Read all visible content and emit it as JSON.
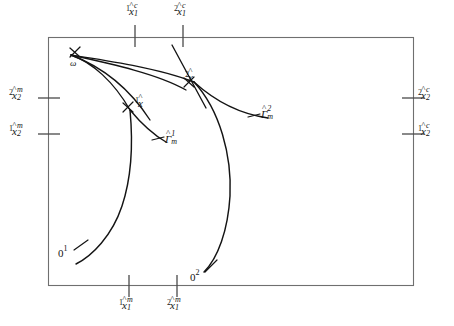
{
  "figure": {
    "kind": "mathematical-phase-plane-diagram",
    "frame": {
      "x": 48,
      "y": 37,
      "width": 365,
      "height": 248,
      "stroke": "#6f6f6f"
    },
    "curve_color": "#141414",
    "tick_color": "#4a4a4a"
  },
  "axis_labels": {
    "top": [
      {
        "id": "top-tick-1",
        "pre": "1",
        "var": "x",
        "hat": "^",
        "sup": "c",
        "sub": "1",
        "x": 131,
        "y": 4
      },
      {
        "id": "top-tick-2",
        "pre": "2",
        "var": "x",
        "hat": "^",
        "sup": "c",
        "sub": "1",
        "x": 178,
        "y": 4
      }
    ],
    "left": [
      {
        "id": "left-tick-2",
        "pre": "2",
        "var": "x",
        "hat": "^",
        "sup": "m",
        "sub": "2",
        "x": 9,
        "y": 90
      },
      {
        "id": "left-tick-1",
        "pre": "1",
        "var": "x",
        "hat": "^",
        "sup": "m",
        "sub": "2",
        "x": 9,
        "y": 126
      }
    ],
    "right": [
      {
        "id": "right-tick-2",
        "pre": "2",
        "var": "x",
        "hat": "^",
        "sup": "c",
        "sub": "2",
        "x": 418,
        "y": 90
      },
      {
        "id": "right-tick-1",
        "pre": "1",
        "var": "x",
        "hat": "^",
        "sup": "c",
        "sub": "2",
        "x": 418,
        "y": 126
      }
    ],
    "bottom": [
      {
        "id": "bottom-tick-1",
        "pre": "1",
        "var": "x",
        "hat": "^",
        "sup": "m",
        "sub": "1",
        "x": 118,
        "y": 296
      },
      {
        "id": "bottom-tick-2",
        "pre": "2",
        "var": "x",
        "hat": "^",
        "sup": "m",
        "sub": "1",
        "x": 166,
        "y": 296
      }
    ]
  },
  "point_labels": [
    {
      "id": "omega",
      "text": "ω",
      "x": 70,
      "y": 61
    },
    {
      "id": "x-hat-1",
      "pre": "1",
      "var": "x",
      "hat": "^",
      "x": 128,
      "y": 98
    },
    {
      "id": "x-hat-2",
      "pre": "2",
      "var": "x",
      "hat": "^",
      "x": 184,
      "y": 73
    },
    {
      "id": "origin-1",
      "num": "0",
      "supn": "1",
      "x": 58,
      "y": 249
    },
    {
      "id": "origin-2",
      "num": "0",
      "supn": "2",
      "x": 194,
      "y": 274
    }
  ],
  "manifold_labels": [
    {
      "id": "gamma-hat-1-m",
      "var": "Γ",
      "hat": "^",
      "sup": "1",
      "sub": "m",
      "x": 166,
      "y": 135
    },
    {
      "id": "gamma-hat-2-m",
      "var": "Γ",
      "hat": "^",
      "sup": "2",
      "sub": "m",
      "x": 262,
      "y": 110
    }
  ],
  "ticks": {
    "top": [
      {
        "x": 135,
        "y1": 25,
        "y2": 47
      },
      {
        "x": 183,
        "y1": 25,
        "y2": 47
      }
    ],
    "bottom": [
      {
        "x": 129,
        "y1": 275,
        "y2": 297
      },
      {
        "x": 177,
        "y1": 275,
        "y2": 297
      }
    ],
    "left": [
      {
        "y": 98,
        "x1": 38,
        "x2": 60
      },
      {
        "y": 134,
        "x1": 38,
        "x2": 60
      }
    ],
    "right": [
      {
        "y": 98,
        "x1": 402,
        "x2": 424
      },
      {
        "y": 134,
        "x1": 402,
        "x2": 424
      }
    ]
  },
  "paths": {
    "trajectory_1": "M 76,264 C 92,256 112,236 122,206 C 132,176 133,142 130,110",
    "trajectory_2": "M 204,272 C 218,258 228,230 230,196 C 232,156 220,110 194,82",
    "ray_omega_to_xhat1": "M 71,55 C 92,62 114,82 130,110",
    "ray_omega_to_xhat2": "M 71,55 C 104,60 158,68 194,82",
    "ray_omega_mid_a": "M 71,55 C 100,66 128,86 150,120",
    "ray_omega_mid_b": "M 71,55 C 112,64 158,74 186,90",
    "manifold_1": "M 130,110 C 140,122 152,134 166,142",
    "manifold_2": "M 194,82 C 216,102 240,114 268,118",
    "manifold_2_upper": "M 172,45 C 180,60 190,78 206,108",
    "short_tail_right": "M 194,82 C 200,92 204,100 208,110",
    "leader_origin_1": "M 74,250 L 86,242",
    "leader_origin_2": "M 203,272 L 214,261",
    "leader_gamma_1": "M 152,140 L 163,137",
    "leader_gamma_2": "M 248,117 L 260,114"
  },
  "crosses": [
    {
      "id": "cross-omega",
      "x": 75,
      "y": 52,
      "r": 5
    },
    {
      "id": "cross-x-hat-1",
      "x": 128,
      "y": 107,
      "r": 5
    },
    {
      "id": "cross-x-hat-2",
      "x": 189,
      "y": 82,
      "r": 5
    }
  ]
}
